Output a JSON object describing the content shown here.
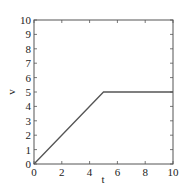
{
  "chart_data": {
    "type": "line",
    "title": "",
    "xlabel": "t",
    "ylabel": "v",
    "xlim": [
      0,
      10
    ],
    "ylim": [
      0,
      10
    ],
    "xticks": [
      0,
      2,
      4,
      6,
      8,
      10
    ],
    "yticks": [
      0,
      1,
      2,
      3,
      4,
      5,
      6,
      7,
      8,
      9,
      10
    ],
    "grid": false,
    "legend": null,
    "series": [
      {
        "name": "v(t)",
        "x": [
          0,
          5,
          10
        ],
        "y": [
          0,
          5,
          5
        ],
        "color": "#555555"
      }
    ]
  },
  "labels": {
    "x_axis": "t",
    "y_axis": "v",
    "xtick_labels": [
      "0",
      "2",
      "4",
      "6",
      "8",
      "10"
    ],
    "ytick_labels": [
      "0",
      "1",
      "2",
      "3",
      "4",
      "5",
      "6",
      "7",
      "8",
      "9",
      "10"
    ]
  }
}
